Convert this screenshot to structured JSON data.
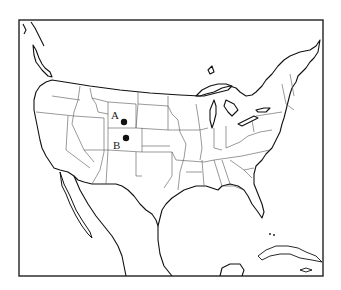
{
  "map": {
    "region": "Contiguous United States",
    "colors": {
      "background": "#ffffff",
      "lines": "#111111",
      "state_borders": "#555555",
      "markers": "#111111"
    },
    "markers": [
      {
        "label": "A",
        "state": "Wyoming",
        "dot": [
          124,
          122
        ],
        "label_pos": [
          111,
          118
        ]
      },
      {
        "label": "B",
        "state": "Colorado",
        "dot": [
          126,
          138
        ],
        "label_pos": [
          113,
          149
        ]
      }
    ]
  }
}
